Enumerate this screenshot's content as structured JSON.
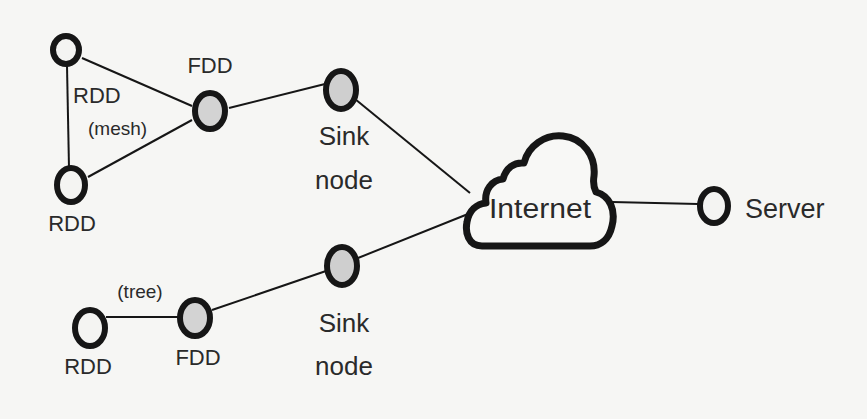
{
  "diagram": {
    "title": "",
    "colors": {
      "background": "#f6f6f4",
      "stroke": "#161616",
      "node_fill_plain": "#f4f4f2",
      "node_fill_gray": "#cfcfcf",
      "text": "#2a2a2a"
    },
    "labels": {
      "rdd_mesh_top": "RDD",
      "mesh_type": "(mesh)",
      "rdd_mesh_bottom": "RDD",
      "fdd_mesh": "FDD",
      "sink_top_line1": "Sink",
      "sink_top_line2": "node",
      "internet": "Internet",
      "server": "Server",
      "tree_type": "(tree)",
      "rdd_tree": "RDD",
      "fdd_tree": "FDD",
      "sink_bottom_line1": "Sink",
      "sink_bottom_line2": "node"
    },
    "nodes": [
      {
        "id": "rdd-mesh-top",
        "type": "RDD",
        "filled": false,
        "cx": 66,
        "cy": 50
      },
      {
        "id": "rdd-mesh-bottom",
        "type": "RDD",
        "filled": false,
        "cx": 71,
        "cy": 185
      },
      {
        "id": "fdd-mesh",
        "type": "FDD",
        "filled": true,
        "cx": 210,
        "cy": 110
      },
      {
        "id": "sink-top",
        "type": "Sink node",
        "filled": true,
        "cx": 341,
        "cy": 89
      },
      {
        "id": "internet",
        "type": "Internet",
        "shape": "cloud",
        "cx": 540,
        "cy": 200
      },
      {
        "id": "server",
        "type": "Server",
        "filled": false,
        "cx": 714,
        "cy": 206
      },
      {
        "id": "rdd-tree",
        "type": "RDD",
        "filled": false,
        "cx": 90,
        "cy": 328
      },
      {
        "id": "fdd-tree",
        "type": "FDD",
        "filled": true,
        "cx": 195,
        "cy": 318
      },
      {
        "id": "sink-bottom",
        "type": "Sink node",
        "filled": true,
        "cx": 342,
        "cy": 265
      }
    ],
    "edges": [
      {
        "from": "rdd-mesh-top",
        "to": "rdd-mesh-bottom"
      },
      {
        "from": "rdd-mesh-top",
        "to": "fdd-mesh"
      },
      {
        "from": "rdd-mesh-bottom",
        "to": "fdd-mesh"
      },
      {
        "from": "fdd-mesh",
        "to": "sink-top"
      },
      {
        "from": "sink-top",
        "to": "internet"
      },
      {
        "from": "rdd-tree",
        "to": "fdd-tree"
      },
      {
        "from": "fdd-tree",
        "to": "sink-bottom"
      },
      {
        "from": "sink-bottom",
        "to": "internet"
      },
      {
        "from": "internet",
        "to": "server"
      }
    ]
  }
}
